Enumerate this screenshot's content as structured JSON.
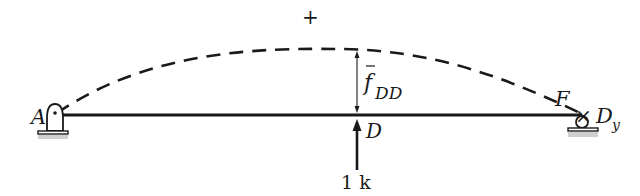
{
  "diagram": {
    "sign_label": "+",
    "deflection_label": "f",
    "deflection_subscript": "DD",
    "point_a": "A",
    "point_d": "D",
    "point_f": "F",
    "redundant_symbol": "×",
    "redundant_label": "D",
    "redundant_subscript": "y",
    "load_label": "1 k",
    "colors": {
      "ink": "#1a1a1a",
      "ground": "#bdbdbd",
      "background": "#ffffff"
    }
  }
}
